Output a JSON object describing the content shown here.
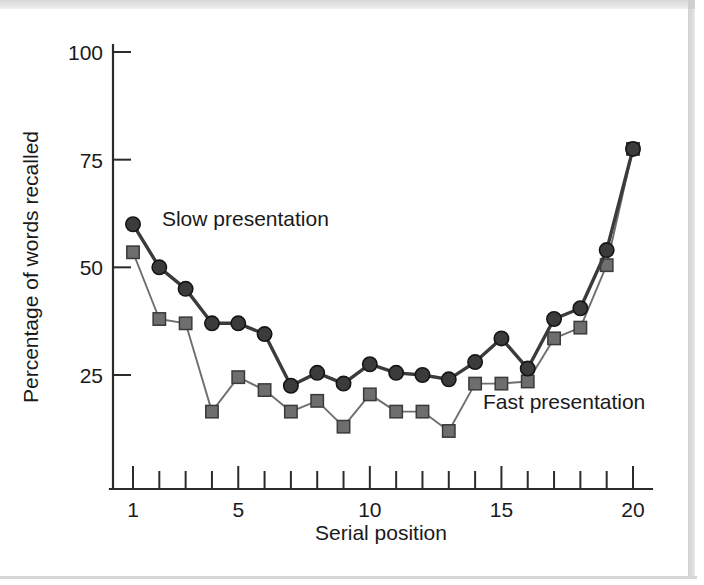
{
  "chart_data": {
    "type": "line",
    "title": "",
    "xlabel": "Serial position",
    "ylabel": "Percentage of words recalled",
    "xlim": [
      1,
      20
    ],
    "ylim": [
      0,
      100
    ],
    "grid": false,
    "legend_position": "inline-annotation",
    "x": [
      1,
      2,
      3,
      4,
      5,
      6,
      7,
      8,
      9,
      10,
      11,
      12,
      13,
      14,
      15,
      16,
      17,
      18,
      19,
      20
    ],
    "x_tick_labels": [
      "1",
      "5",
      "10",
      "15",
      "20"
    ],
    "x_tick_values": [
      1,
      5,
      10,
      15,
      20
    ],
    "y_tick_labels": [
      "25",
      "50",
      "75",
      "100"
    ],
    "y_tick_values": [
      25,
      50,
      75,
      100
    ],
    "series": [
      {
        "name": "Slow presentation",
        "marker": "circle",
        "color": "#3b3b3b",
        "line_width": 3.4,
        "values": [
          60,
          50,
          45,
          37,
          37,
          34.5,
          22.5,
          25.5,
          23,
          27.5,
          25.5,
          25,
          24,
          28,
          33.5,
          26.5,
          38,
          40.5,
          54,
          77.5
        ]
      },
      {
        "name": "Fast presentation",
        "marker": "square",
        "color": "#6e6e6e",
        "line_width": 1.9,
        "values": [
          53.5,
          38,
          37,
          16.5,
          24.5,
          21.5,
          16.5,
          19,
          13,
          20.5,
          16.5,
          16.5,
          12,
          23,
          23,
          23.5,
          33.5,
          36,
          50.5,
          77.5
        ]
      }
    ],
    "annotations": [
      {
        "text": "Slow presentation",
        "x": 2.1,
        "y": 59.5
      },
      {
        "text": "Fast presentation",
        "x": 14.3,
        "y": 17.0
      }
    ]
  }
}
